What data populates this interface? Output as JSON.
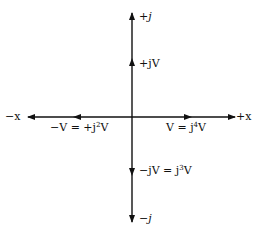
{
  "diagram": {
    "axes": {
      "pos_x": "+x",
      "neg_x": "−x",
      "pos_j": "+j",
      "neg_j": "−j"
    },
    "phasors": [
      {
        "id": "V",
        "label": "V = j",
        "exp": "4",
        "suffix": "V",
        "direction": "right"
      },
      {
        "id": "jV",
        "label": "+jV",
        "direction": "up"
      },
      {
        "id": "negV",
        "label": "−V = +j",
        "exp": "2",
        "suffix": "V",
        "direction": "left"
      },
      {
        "id": "negjV",
        "label": "−jV = j",
        "exp": "3",
        "suffix": "V",
        "direction": "down"
      }
    ]
  }
}
